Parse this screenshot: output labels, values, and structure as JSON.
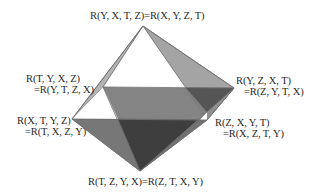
{
  "colors": {
    "background": "#ffffff",
    "edge": "#6e6e6e",
    "face_front_upper": "#ffffff",
    "face_back_upper": "#a4a4a4",
    "face_sliver": "#b4b4b4",
    "face_equator_back": "#7e7e7e",
    "face_lower_left": "#777777",
    "face_lower_front": "#3e3e3e",
    "face_lower_right": "#9a9a9a",
    "face_back_right_dark": "#555555",
    "text": "#2a2a2a"
  },
  "vertices": {
    "top": {
      "x": 143,
      "y": 26,
      "label_lines": [
        "R(Y, X, T, Z)=R(X, Y, Z, T)"
      ]
    },
    "back_left": {
      "x": 103,
      "y": 87,
      "label_lines": [
        "R(T, Y, X, Z)",
        "=R(Y, T, Z, X)"
      ]
    },
    "right_back": {
      "x": 234,
      "y": 88,
      "label_lines": [
        "R(Y, Z, X, T)",
        "=R(Z, Y, T, X)"
      ]
    },
    "left": {
      "x": 72,
      "y": 119,
      "label_lines": [
        "R(X, T, Y, Z)",
        "=R(T, X, Z, Y)"
      ]
    },
    "right_front": {
      "x": 207,
      "y": 120,
      "label_lines": [
        "R(Z, X, Y, T)",
        "=R(X, Z, T, Y)"
      ]
    },
    "bottom": {
      "x": 140,
      "y": 171,
      "label_lines": [
        "R(T, Z, Y, X)=R(Z, T, X, Y)"
      ]
    }
  }
}
